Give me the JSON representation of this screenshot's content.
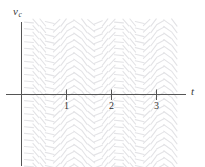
{
  "figure": {
    "type": "slope-field",
    "axes": {
      "y_axis_label": "v",
      "y_axis_subscript": "c",
      "x_axis_label": "t"
    }
  },
  "chart_data": {
    "type": "scatter",
    "title": "",
    "subtitle": "",
    "xlabel": "t",
    "ylabel": "v_c",
    "grid": false,
    "legend": null,
    "xlim": [
      -0.45,
      3.55
    ],
    "ylim": [
      -1.6,
      1.6
    ],
    "x_ticks": [
      1,
      2,
      3
    ],
    "x_tick_labels": [
      "1",
      "2",
      "3"
    ],
    "y_ticks": [],
    "y_tick_labels": [],
    "annotations": [],
    "field": {
      "dash_color": "#e3e3e6",
      "axis_color": "#555555",
      "x_range": [
        -0.45,
        3.55
      ],
      "y_range": [
        -1.6,
        1.6
      ],
      "columns": 26,
      "rows": 22,
      "period": 1.0,
      "slope_formula": "m(t) = 1.35 * cos(2*pi*t + 0.6)",
      "dash_length_px": 9
    }
  },
  "ticks": [
    {
      "label": "1",
      "value": 1
    },
    {
      "label": "2",
      "value": 2
    },
    {
      "label": "3",
      "value": 3
    }
  ],
  "colors": {
    "background": "#ffffff",
    "axis": "#555555",
    "dash": "#e3e3e6",
    "text": "#333333"
  }
}
